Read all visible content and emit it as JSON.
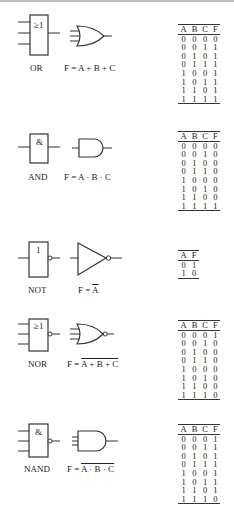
{
  "gates": [
    {
      "name": "OR",
      "iec_symbol": "≥1",
      "formula": "F = A + B + C",
      "formula_overlined": false,
      "columns": [
        "A",
        "B",
        "C",
        "F"
      ],
      "rows": [
        [
          "0",
          "0",
          "0",
          "0"
        ],
        [
          "0",
          "0",
          "1",
          "1"
        ],
        [
          "0",
          "1",
          "0",
          "1"
        ],
        [
          "0",
          "1",
          "1",
          "1"
        ],
        [
          "1",
          "0",
          "0",
          "1"
        ],
        [
          "1",
          "0",
          "1",
          "1"
        ],
        [
          "1",
          "1",
          "0",
          "1"
        ],
        [
          "1",
          "1",
          "1",
          "1"
        ]
      ]
    },
    {
      "name": "AND",
      "iec_symbol": "&",
      "formula": "F = A · B · C",
      "formula_overlined": false,
      "columns": [
        "A",
        "B",
        "C",
        "F"
      ],
      "rows": [
        [
          "0",
          "0",
          "0",
          "0"
        ],
        [
          "0",
          "0",
          "1",
          "0"
        ],
        [
          "0",
          "1",
          "0",
          "0"
        ],
        [
          "0",
          "1",
          "1",
          "0"
        ],
        [
          "1",
          "0",
          "0",
          "0"
        ],
        [
          "1",
          "0",
          "1",
          "0"
        ],
        [
          "1",
          "1",
          "0",
          "0"
        ],
        [
          "1",
          "1",
          "1",
          "1"
        ]
      ]
    },
    {
      "name": "NOT",
      "iec_symbol": "1",
      "formula_prefix": "F = ",
      "formula_over": "A",
      "columns": [
        "A",
        "F"
      ],
      "rows": [
        [
          "0",
          "1"
        ],
        [
          "1",
          "0"
        ]
      ]
    },
    {
      "name": "NOR",
      "iec_symbol": "≥1",
      "formula_prefix": "F = ",
      "formula_over": "A + B + C",
      "columns": [
        "A",
        "B",
        "C",
        "F"
      ],
      "rows": [
        [
          "0",
          "0",
          "0",
          "1"
        ],
        [
          "0",
          "0",
          "1",
          "0"
        ],
        [
          "0",
          "1",
          "0",
          "0"
        ],
        [
          "0",
          "1",
          "1",
          "0"
        ],
        [
          "1",
          "0",
          "0",
          "0"
        ],
        [
          "1",
          "0",
          "1",
          "0"
        ],
        [
          "1",
          "1",
          "0",
          "0"
        ],
        [
          "1",
          "1",
          "1",
          "0"
        ]
      ]
    },
    {
      "name": "NAND",
      "iec_symbol": "&",
      "formula_prefix": "F = ",
      "formula_over": "A · B · C",
      "columns": [
        "A",
        "B",
        "C",
        "F"
      ],
      "rows": [
        [
          "0",
          "0",
          "0",
          "1"
        ],
        [
          "0",
          "0",
          "1",
          "1"
        ],
        [
          "0",
          "1",
          "0",
          "1"
        ],
        [
          "0",
          "1",
          "1",
          "1"
        ],
        [
          "1",
          "0",
          "0",
          "1"
        ],
        [
          "1",
          "0",
          "1",
          "1"
        ],
        [
          "1",
          "1",
          "0",
          "1"
        ],
        [
          "1",
          "1",
          "1",
          "0"
        ]
      ]
    }
  ]
}
